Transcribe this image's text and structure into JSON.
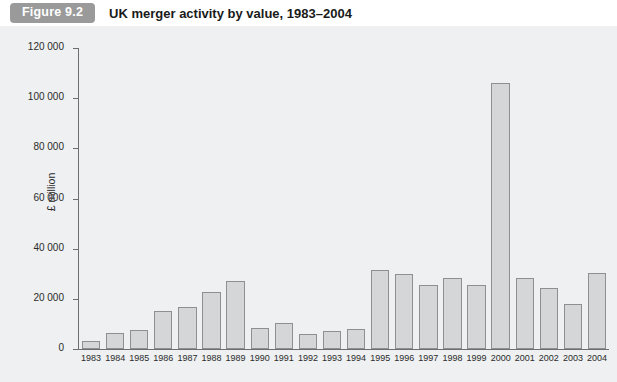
{
  "figure": {
    "tag": "Figure 9.2",
    "title": "UK merger activity by value, 1983–2004",
    "tag_color": "#9a9a9a",
    "panel_color": "#eef0f1",
    "bar_fill": "#d4d6d7",
    "bar_stroke": "#8d8f90"
  },
  "chart_data": {
    "type": "bar",
    "title": "UK merger activity by value, 1983–2004",
    "xlabel": "",
    "ylabel": "£ million",
    "ylim": [
      0,
      120000
    ],
    "ytick_labels": [
      "120 000",
      "100 000",
      "80 000",
      "60 000",
      "40 000",
      "20 000",
      "0"
    ],
    "ytick_values": [
      120000,
      100000,
      80000,
      60000,
      40000,
      20000,
      0
    ],
    "grid": false,
    "legend": null,
    "categories": [
      "1983",
      "1984",
      "1985",
      "1986",
      "1987",
      "1988",
      "1989",
      "1990",
      "1991",
      "1992",
      "1993",
      "1994",
      "1995",
      "1996",
      "1997",
      "1998",
      "1999",
      "2000",
      "2001",
      "2002",
      "2003",
      "2004"
    ],
    "values": [
      3200,
      6500,
      7500,
      15000,
      16800,
      22800,
      27200,
      8500,
      10500,
      6000,
      7000,
      8000,
      31500,
      30000,
      25500,
      28500,
      25500,
      106000,
      28500,
      24500,
      18000,
      30500
    ]
  }
}
